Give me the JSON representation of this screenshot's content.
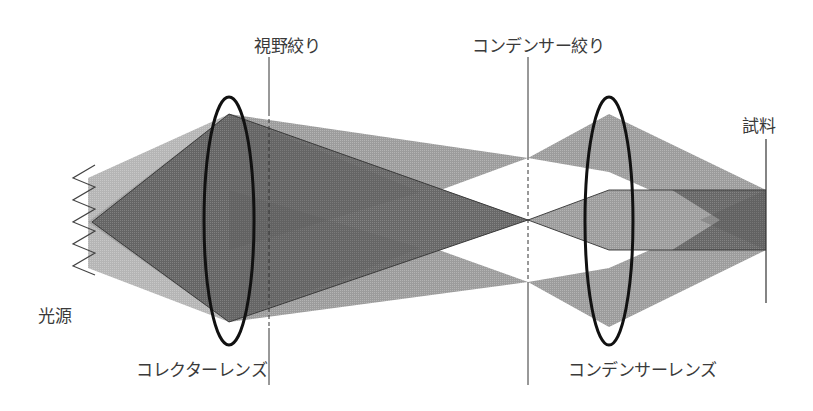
{
  "diagram": {
    "labels": {
      "light_source": "光源",
      "collector_lens": "コレクターレンズ",
      "field_stop": "視野絞り",
      "condenser_stop": "コンデンサー絞り",
      "condenser_lens": "コンデンサーレンズ",
      "sample": "試料"
    },
    "colors": {
      "background": "#ffffff",
      "light_beam": "#a8a8a8",
      "dark_beam": "#6e6e6e",
      "lens_outline": "#111111",
      "line": "#333333",
      "label_text": "#3a3a3a"
    }
  }
}
